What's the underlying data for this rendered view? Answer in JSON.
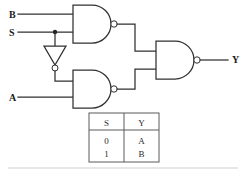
{
  "diagram": {
    "inputs": [
      {
        "id": "B",
        "label": "B"
      },
      {
        "id": "S",
        "label": "S"
      },
      {
        "id": "A",
        "label": "A"
      }
    ],
    "outputs": [
      {
        "id": "Y",
        "label": "Y"
      }
    ],
    "gates": [
      {
        "id": "nand1",
        "type": "nand",
        "label": "",
        "inputs": [
          "B",
          "S"
        ],
        "output": "n1"
      },
      {
        "id": "inv1",
        "type": "inverter",
        "label": "",
        "inputs": [
          "S"
        ],
        "output": "sbar"
      },
      {
        "id": "nand2",
        "type": "nand",
        "label": "",
        "inputs": [
          "sbar",
          "A"
        ],
        "output": "n2"
      },
      {
        "id": "nand3",
        "type": "nand",
        "label": "",
        "inputs": [
          "n1",
          "n2"
        ],
        "output": "Y"
      }
    ],
    "junctions": [
      {
        "id": "s-tap",
        "on": "S"
      }
    ]
  },
  "truth_table": {
    "headers": [
      "S",
      "Y"
    ],
    "rows": [
      [
        "0",
        "A"
      ],
      [
        "1",
        "B"
      ]
    ]
  },
  "colors": {
    "ink": "#303030",
    "label": "#1a1a1a",
    "table_rule": "#5a5a5a",
    "background": "#ffffff"
  }
}
